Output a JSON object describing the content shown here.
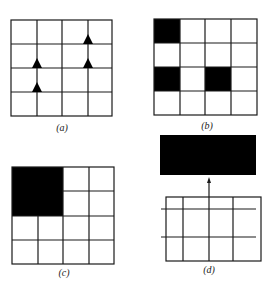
{
  "figure": {
    "colors": {
      "line": "#1a1a1a",
      "fill": "#000000",
      "background": "#ffffff"
    },
    "panels": [
      {
        "id": "a",
        "label": "(a)",
        "grid": {
          "rows": 4,
          "cols": 4
        },
        "markers": [
          {
            "shape": "triangle-up",
            "row_line": 1,
            "col_line": 3
          },
          {
            "shape": "triangle-up",
            "row_line": 2,
            "col_line": 1
          },
          {
            "shape": "triangle-up",
            "row_line": 2,
            "col_line": 3
          },
          {
            "shape": "triangle-up",
            "row_line": 3,
            "col_line": 1
          }
        ]
      },
      {
        "id": "b",
        "label": "(b)",
        "grid": {
          "rows": 4,
          "cols": 4
        },
        "filled_cells": [
          {
            "row": 0,
            "col": 0
          },
          {
            "row": 2,
            "col": 0
          },
          {
            "row": 2,
            "col": 2
          }
        ]
      },
      {
        "id": "c",
        "label": "(c)",
        "grid": {
          "rows": 4,
          "cols": 4
        },
        "filled_block": {
          "row": 0,
          "col": 0,
          "rows": 2,
          "cols": 2
        }
      },
      {
        "id": "d",
        "label": "(d)",
        "grid": {
          "rows": 3,
          "cols": 4
        },
        "top_block": "solid black rectangle",
        "arrow": "up, from grid to block"
      }
    ]
  }
}
